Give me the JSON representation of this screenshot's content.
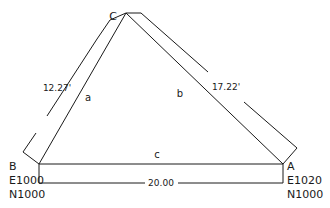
{
  "diagram": {
    "type": "survey-triangle",
    "line_color": "#1a1a1a",
    "background": "#ffffff",
    "vertices": [
      {
        "id": "A",
        "label": "A",
        "easting": "E1020",
        "northing": "N1000"
      },
      {
        "id": "B",
        "label": "B",
        "easting": "E1000",
        "northing": "N1000"
      },
      {
        "id": "C",
        "label": "C"
      }
    ],
    "sides": [
      {
        "id": "a",
        "label": "a",
        "from": "B",
        "to": "C",
        "length": "12.27'"
      },
      {
        "id": "b",
        "label": "b",
        "from": "C",
        "to": "A",
        "length": "17.22'"
      },
      {
        "id": "c",
        "label": "c",
        "from": "B",
        "to": "A",
        "length": "20.00"
      }
    ]
  }
}
